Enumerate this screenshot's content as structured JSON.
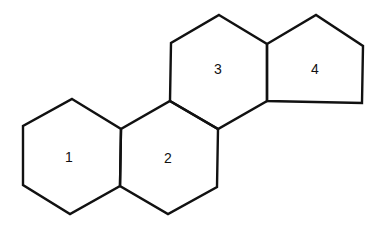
{
  "diagram": {
    "type": "fused-ring-structure",
    "stroke_color": "#111111",
    "background": "#ffffff",
    "rings": [
      {
        "id": "ring-1",
        "label": "1",
        "shape": "hexagon",
        "points": "72,99 121,129 120,186 70,214 23,185 23,126",
        "label_pos": [
          69,
          157
        ]
      },
      {
        "id": "ring-2",
        "label": "2",
        "shape": "hexagon",
        "points": "170,101 218,129 217,187 168,214 120,186 121,129",
        "label_pos": [
          168,
          158
        ]
      },
      {
        "id": "ring-3",
        "label": "3",
        "shape": "hexagon",
        "points": "219,15 267,44 267,101 218,129 170,101 171,43",
        "label_pos": [
          218,
          69
        ]
      },
      {
        "id": "ring-4",
        "label": "4",
        "shape": "pentagon",
        "points": "267,44 316,15 363,46 362,103 267,101",
        "label_pos": [
          315,
          69
        ]
      }
    ]
  }
}
